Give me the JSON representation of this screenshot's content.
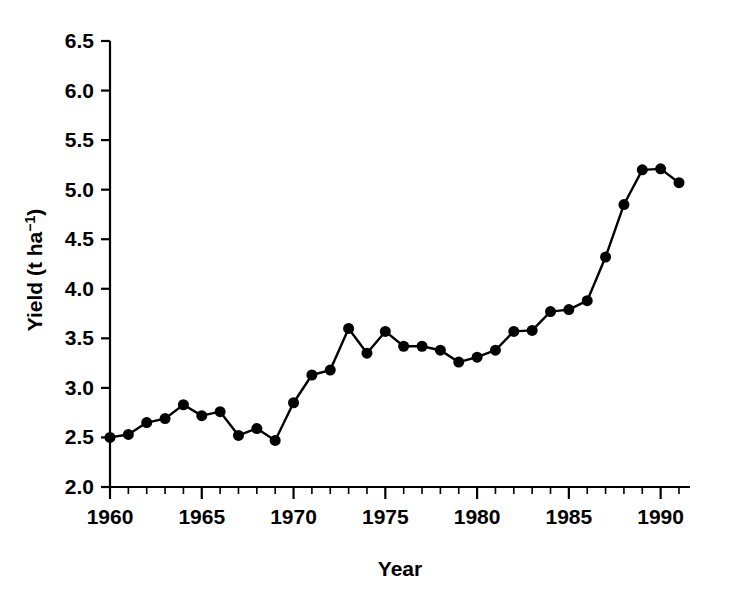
{
  "chart_data": {
    "type": "line",
    "title": "",
    "xlabel": "Year",
    "ylabel": "Yield (t ha-1)",
    "ylabel_parts": {
      "base": "Yield (t ha",
      "superscript": "−1",
      "tail": ")"
    },
    "x": [
      1960,
      1961,
      1962,
      1963,
      1964,
      1965,
      1966,
      1967,
      1968,
      1969,
      1970,
      1971,
      1972,
      1973,
      1974,
      1975,
      1976,
      1977,
      1978,
      1979,
      1980,
      1981,
      1982,
      1983,
      1984,
      1985,
      1986,
      1987,
      1988,
      1989,
      1990,
      1991
    ],
    "values": [
      2.5,
      2.53,
      2.65,
      2.69,
      2.83,
      2.72,
      2.76,
      2.52,
      2.59,
      2.47,
      2.85,
      3.13,
      3.18,
      3.6,
      3.35,
      3.57,
      3.42,
      3.42,
      3.38,
      3.26,
      3.31,
      3.38,
      3.57,
      3.58,
      3.77,
      3.79,
      3.88,
      4.32,
      4.85,
      5.2,
      5.21,
      5.07
    ],
    "series": [
      {
        "name": "Yield",
        "values": [
          2.5,
          2.53,
          2.65,
          2.69,
          2.83,
          2.72,
          2.76,
          2.52,
          2.59,
          2.47,
          2.85,
          3.13,
          3.18,
          3.6,
          3.35,
          3.57,
          3.42,
          3.42,
          3.38,
          3.26,
          3.31,
          3.38,
          3.57,
          3.58,
          3.77,
          3.79,
          3.88,
          4.32,
          4.85,
          5.2,
          5.21,
          5.07
        ]
      }
    ],
    "xlim": [
      1960,
      1991.6
    ],
    "ylim": [
      2.0,
      6.5
    ],
    "xtick_labels": [
      "1960",
      "1965",
      "1970",
      "1975",
      "1980",
      "1985",
      "1990"
    ],
    "xtick_values": [
      1960,
      1965,
      1970,
      1975,
      1980,
      1985,
      1990
    ],
    "xminor_step": 1,
    "ytick_labels": [
      "2.0",
      "2.5",
      "3.0",
      "3.5",
      "4.0",
      "4.5",
      "5.0",
      "5.5",
      "6.0",
      "6.5"
    ],
    "ytick_values": [
      2.0,
      2.5,
      3.0,
      3.5,
      4.0,
      4.5,
      5.0,
      5.5,
      6.0,
      6.5
    ],
    "grid": false,
    "legend": null,
    "line_color": "#000000",
    "marker_color": "#000000",
    "marker": "circle",
    "marker_size": 6,
    "line_width": 2,
    "axis_color": "#000000",
    "background_color": "#ffffff"
  }
}
